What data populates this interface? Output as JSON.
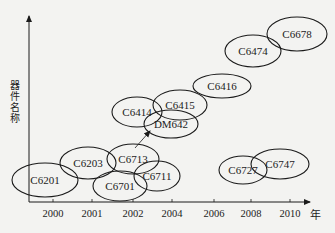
{
  "axes": {
    "y_label": "器件名称",
    "x_unit": "年",
    "x_ticks": [
      {
        "label": "2000",
        "x": 53
      },
      {
        "label": "2001",
        "x": 92
      },
      {
        "label": "2002",
        "x": 133
      },
      {
        "label": "2004",
        "x": 172
      },
      {
        "label": "2006",
        "x": 214
      },
      {
        "label": "2008",
        "x": 251
      },
      {
        "label": "2010",
        "x": 290
      }
    ]
  },
  "nodes": [
    {
      "id": "c6201",
      "label": "C6201",
      "cx": 45,
      "cy": 180,
      "rx": 33,
      "ry": 17
    },
    {
      "id": "c6203",
      "label": "C6203",
      "cx": 88,
      "cy": 163,
      "rx": 28,
      "ry": 16
    },
    {
      "id": "c6713",
      "label": "C6713",
      "cx": 133,
      "cy": 159,
      "rx": 26,
      "ry": 15
    },
    {
      "id": "c6701",
      "label": "C6701",
      "cx": 120,
      "cy": 186,
      "rx": 27,
      "ry": 15
    },
    {
      "id": "c6711",
      "label": "C6711",
      "cx": 157,
      "cy": 176,
      "rx": 23,
      "ry": 15
    },
    {
      "id": "c6414",
      "label": "C6414",
      "cx": 137,
      "cy": 112,
      "rx": 25,
      "ry": 15
    },
    {
      "id": "c6415",
      "label": "C6415",
      "cx": 180,
      "cy": 105,
      "rx": 27,
      "ry": 15
    },
    {
      "id": "dm642",
      "label": "DM642",
      "cx": 171,
      "cy": 124,
      "rx": 27,
      "ry": 14
    },
    {
      "id": "c6416",
      "label": "C6416",
      "cx": 222,
      "cy": 86,
      "rx": 29,
      "ry": 12
    },
    {
      "id": "c6474",
      "label": "C6474",
      "cx": 253,
      "cy": 51,
      "rx": 28,
      "ry": 16
    },
    {
      "id": "c6678",
      "label": "C6678",
      "cx": 297,
      "cy": 34,
      "rx": 30,
      "ry": 17
    },
    {
      "id": "c6727",
      "label": "C6727",
      "cx": 243,
      "cy": 170,
      "rx": 24,
      "ry": 14
    },
    {
      "id": "c6747",
      "label": "C6747",
      "cx": 280,
      "cy": 164,
      "rx": 29,
      "ry": 15
    }
  ],
  "edges": [
    {
      "from": "c6713",
      "to": "dm642",
      "x1": 135,
      "y1": 148,
      "x2": 150,
      "y2": 131
    }
  ],
  "colors": {
    "stroke": "#1a1a1a",
    "background": "#f3f3f1",
    "text": "#222222"
  }
}
